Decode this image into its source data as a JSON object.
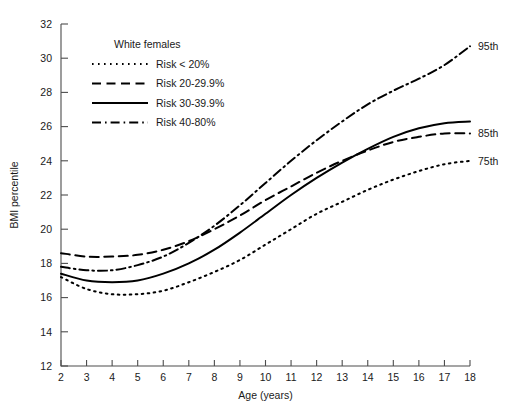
{
  "chart_data": {
    "type": "line",
    "title": "",
    "subtitle": "",
    "xlabel": "Age (years)",
    "ylabel": "BMI percentile",
    "xlim": [
      2,
      18
    ],
    "ylim": [
      12,
      32
    ],
    "xticks": [
      2,
      3,
      4,
      5,
      6,
      7,
      8,
      9,
      10,
      11,
      12,
      13,
      14,
      15,
      16,
      17,
      18
    ],
    "yticks": [
      12,
      14,
      16,
      18,
      20,
      22,
      24,
      26,
      28,
      30,
      32
    ],
    "grid": false,
    "legend_position": "top-left",
    "legend_title": "White females",
    "x": [
      2,
      3,
      4,
      5,
      6,
      7,
      8,
      9,
      10,
      11,
      12,
      13,
      14,
      15,
      16,
      17,
      18
    ],
    "series": [
      {
        "name": "Risk < 20%",
        "dash": "dotted",
        "end_label": "",
        "values": [
          17.2,
          16.5,
          16.2,
          16.2,
          16.4,
          16.9,
          17.5,
          18.2,
          19.1,
          20.0,
          20.9,
          21.6,
          22.3,
          22.9,
          23.4,
          23.8,
          24.0
        ]
      },
      {
        "name": "Risk 20-29.9%",
        "dash": "dashed",
        "end_label": "75th",
        "values": [
          18.6,
          18.4,
          18.4,
          18.5,
          18.8,
          19.3,
          20.0,
          20.8,
          21.7,
          22.5,
          23.3,
          24.0,
          24.6,
          25.1,
          25.4,
          25.6,
          25.6
        ]
      },
      {
        "name": "Risk 30-39.9%",
        "dash": "solid",
        "end_label": "85th",
        "values": [
          17.4,
          17.0,
          16.9,
          17.0,
          17.4,
          18.0,
          18.8,
          19.8,
          20.9,
          22.0,
          23.0,
          23.9,
          24.7,
          25.4,
          25.9,
          26.2,
          26.3
        ]
      },
      {
        "name": "Risk 40-80%",
        "dash": "dashdot",
        "end_label": "95th",
        "values": [
          17.8,
          17.6,
          17.6,
          17.9,
          18.4,
          19.2,
          20.2,
          21.4,
          22.7,
          24.0,
          25.2,
          26.3,
          27.3,
          28.1,
          28.8,
          29.6,
          30.7
        ]
      }
    ],
    "end_labels": [
      {
        "text": "95th",
        "value": 30.7
      },
      {
        "text": "85th",
        "value": 25.6
      },
      {
        "text": "75th",
        "value": 24.0
      }
    ]
  }
}
